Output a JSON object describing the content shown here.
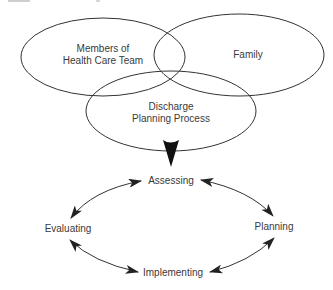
{
  "diagram": {
    "colors": {
      "stroke": "#333333",
      "text": "#3a3a3a",
      "background": "#ffffff"
    },
    "venn": {
      "members_label_line1": "Members of",
      "members_label_line2": "Health Care Team",
      "family_label": "Family",
      "discharge_label_line1": "Discharge",
      "discharge_label_line2": "Planning Process"
    },
    "cycle": {
      "top": "Assessing",
      "right": "Planning",
      "bottom": "Implementing",
      "left": "Evaluating"
    }
  }
}
